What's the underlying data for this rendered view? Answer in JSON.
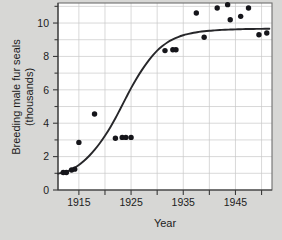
{
  "chart_data": {
    "type": "scatter",
    "title": "",
    "xlabel": "Year",
    "ylabel": "Breeding male fur seals (thousands)",
    "ylabel_line1": "Breeding male fur seals",
    "ylabel_line2": "(thousands)",
    "xlim": [
      1911,
      1952
    ],
    "ylim": [
      0,
      11.2
    ],
    "grid": true,
    "legend": null,
    "x_ticks_major": [
      1915,
      1925,
      1935,
      1945
    ],
    "x_ticks_major_labels": [
      "1915",
      "1925",
      "1935",
      "1945"
    ],
    "x_ticks_minor": [
      1915,
      1920,
      1925,
      1930,
      1935,
      1940,
      1945,
      1950
    ],
    "y_ticks_major": [
      0,
      2,
      4,
      6,
      8,
      10
    ],
    "y_ticks_major_labels": [
      "0",
      "2",
      "4",
      "6",
      "8",
      "10"
    ],
    "y_ticks_minor": [
      1,
      3,
      5,
      7,
      9,
      11
    ],
    "points": [
      {
        "x": 1912.0,
        "y": 1.05
      },
      {
        "x": 1912.6,
        "y": 1.05
      },
      {
        "x": 1913.6,
        "y": 1.2
      },
      {
        "x": 1914.2,
        "y": 1.25
      },
      {
        "x": 1915.0,
        "y": 2.85
      },
      {
        "x": 1918.0,
        "y": 4.55
      },
      {
        "x": 1922.0,
        "y": 3.1
      },
      {
        "x": 1923.3,
        "y": 3.15
      },
      {
        "x": 1924.0,
        "y": 3.15
      },
      {
        "x": 1925.0,
        "y": 3.15
      },
      {
        "x": 1931.5,
        "y": 8.35
      },
      {
        "x": 1933.0,
        "y": 8.4
      },
      {
        "x": 1933.6,
        "y": 8.4
      },
      {
        "x": 1937.5,
        "y": 10.6
      },
      {
        "x": 1939.0,
        "y": 9.15
      },
      {
        "x": 1941.5,
        "y": 10.9
      },
      {
        "x": 1943.5,
        "y": 11.1
      },
      {
        "x": 1944.0,
        "y": 10.2
      },
      {
        "x": 1946.0,
        "y": 10.4
      },
      {
        "x": 1947.5,
        "y": 10.9
      },
      {
        "x": 1949.5,
        "y": 9.3
      },
      {
        "x": 1951.0,
        "y": 9.4
      }
    ],
    "fit_curve": {
      "kind": "logistic",
      "description": "Logistic growth curve fitted to breeding male fur seal counts",
      "points": [
        {
          "x": 1911.0,
          "y": 0.98
        },
        {
          "x": 1912.0,
          "y": 1.05
        },
        {
          "x": 1913.0,
          "y": 1.15
        },
        {
          "x": 1914.0,
          "y": 1.3
        },
        {
          "x": 1915.0,
          "y": 1.5
        },
        {
          "x": 1916.0,
          "y": 1.75
        },
        {
          "x": 1917.0,
          "y": 2.05
        },
        {
          "x": 1918.0,
          "y": 2.4
        },
        {
          "x": 1919.0,
          "y": 2.8
        },
        {
          "x": 1920.0,
          "y": 3.25
        },
        {
          "x": 1921.0,
          "y": 3.75
        },
        {
          "x": 1922.0,
          "y": 4.3
        },
        {
          "x": 1923.0,
          "y": 4.9
        },
        {
          "x": 1924.0,
          "y": 5.5
        },
        {
          "x": 1925.0,
          "y": 6.1
        },
        {
          "x": 1926.0,
          "y": 6.65
        },
        {
          "x": 1927.0,
          "y": 7.15
        },
        {
          "x": 1928.0,
          "y": 7.6
        },
        {
          "x": 1929.0,
          "y": 8.0
        },
        {
          "x": 1930.0,
          "y": 8.35
        },
        {
          "x": 1931.0,
          "y": 8.62
        },
        {
          "x": 1932.0,
          "y": 8.85
        },
        {
          "x": 1933.0,
          "y": 9.02
        },
        {
          "x": 1934.0,
          "y": 9.16
        },
        {
          "x": 1935.0,
          "y": 9.27
        },
        {
          "x": 1936.0,
          "y": 9.35
        },
        {
          "x": 1937.0,
          "y": 9.42
        },
        {
          "x": 1938.0,
          "y": 9.47
        },
        {
          "x": 1939.0,
          "y": 9.51
        },
        {
          "x": 1940.0,
          "y": 9.54
        },
        {
          "x": 1941.0,
          "y": 9.56
        },
        {
          "x": 1942.0,
          "y": 9.58
        },
        {
          "x": 1943.0,
          "y": 9.6
        },
        {
          "x": 1944.0,
          "y": 9.61
        },
        {
          "x": 1945.0,
          "y": 9.62
        },
        {
          "x": 1946.0,
          "y": 9.63
        },
        {
          "x": 1947.0,
          "y": 9.64
        },
        {
          "x": 1948.0,
          "y": 9.64
        },
        {
          "x": 1949.0,
          "y": 9.65
        },
        {
          "x": 1950.0,
          "y": 9.65
        },
        {
          "x": 1951.5,
          "y": 9.66
        }
      ]
    },
    "colors": {
      "background": "#d7d7d5",
      "plot_background": "#ffffff",
      "grid": "#c9c9c9",
      "point": "#15151a",
      "curve": "#27272a",
      "axis": "#3a3a3a",
      "frame": "#6e6e6e",
      "text": "#1c1c1c"
    }
  }
}
